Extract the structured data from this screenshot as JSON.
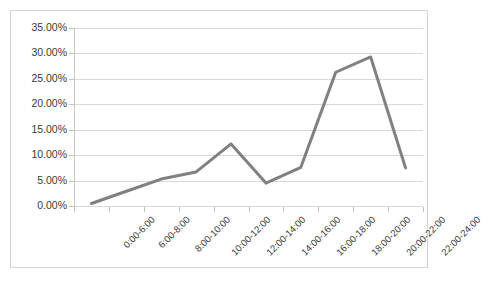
{
  "chart_data": {
    "type": "line",
    "title": "",
    "subtitle": "",
    "xlabel": "",
    "ylabel": "",
    "categories": [
      "0:00-6:00",
      "6:00-8:00",
      "8:00-10:00",
      "10:00-12:00",
      "12:00-14:00",
      "14:00-16:00",
      "16:00-18:00",
      "18:00-20:00",
      "20:00-22:00",
      "22:00-24:00"
    ],
    "values": [
      0.5,
      2.9,
      5.3,
      6.7,
      12.2,
      4.5,
      7.6,
      26.3,
      29.3,
      7.5
    ],
    "value_unit": "%",
    "ylim": [
      0,
      35
    ],
    "ytick_values": [
      0,
      5,
      10,
      15,
      20,
      25,
      30,
      35
    ],
    "ytick_labels": [
      "0.00%",
      "5.00%",
      "10.00%",
      "15.00%",
      "20.00%",
      "25.00%",
      "30.00%",
      "35.00%"
    ],
    "grid": true,
    "legend": false,
    "legend_position": "none",
    "series": [
      {
        "name": "",
        "color": "#808080",
        "values": [
          0.5,
          2.9,
          5.3,
          6.7,
          12.2,
          4.5,
          7.6,
          26.3,
          29.3,
          7.5
        ]
      }
    ]
  },
  "style": {
    "line_color": "#808080",
    "grid_color": "#d9d9d9",
    "axis_color": "#c0c0c0",
    "border_color": "#d4d4d4",
    "text_color": "#3a3a3a",
    "background": "#ffffff"
  }
}
